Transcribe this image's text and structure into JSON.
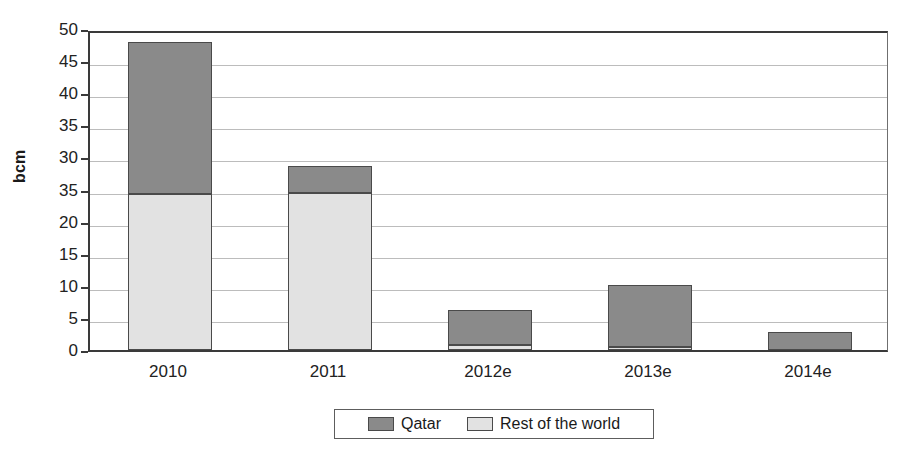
{
  "chart_data": {
    "type": "bar",
    "subtype": "stacked-vertical",
    "title": "",
    "xlabel": "",
    "ylabel": "bcm",
    "ylim": [
      0,
      50
    ],
    "ytick_step": 5,
    "ytick_labels": [
      "50",
      "45",
      "40",
      "35",
      "30",
      "35",
      "20",
      "15",
      "10",
      "5",
      "0"
    ],
    "ytick_values": [
      50,
      45,
      40,
      35,
      30,
      25,
      20,
      15,
      10,
      5,
      0
    ],
    "ytick_note": "The tick at the 25 position is printed as '35' in the source image (scan/typo artifact); reproduced verbatim.",
    "grid": true,
    "grid_axis": "y",
    "legend_position": "bottom-center",
    "categories": [
      "2010",
      "2011",
      "2012e",
      "2013e",
      "2014e"
    ],
    "series": [
      {
        "name": "Qatar",
        "color": "#8a8a8a",
        "values": [
          23.7,
          4.2,
          5.4,
          9.6,
          2.8
        ]
      },
      {
        "name": "Rest of the world",
        "color": "#e2e2e2",
        "values": [
          24.3,
          24.5,
          0.8,
          0.5,
          0.0
        ]
      }
    ],
    "totals": [
      48.0,
      28.7,
      6.2,
      10.1,
      2.8
    ]
  },
  "legend": {
    "items": [
      {
        "label": "Qatar",
        "color": "#8a8a8a"
      },
      {
        "label": "Rest of the world",
        "color": "#e2e2e2"
      }
    ]
  },
  "axis": {
    "y_title": "bcm"
  },
  "colors": {
    "qatar": "#8a8a8a",
    "rest_of_world": "#e2e2e2",
    "bar_outline": "#4a4a4a",
    "frame": "#3a3a3a",
    "gridline": "#bcbcbc",
    "background": "#ffffff",
    "text": "#1a1a1a"
  }
}
